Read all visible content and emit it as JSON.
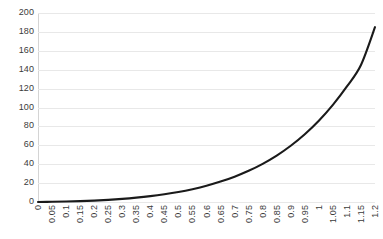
{
  "chart_data": {
    "type": "line",
    "title": "",
    "subtitle": "",
    "xlabel": "",
    "ylabel": "",
    "legend": [],
    "legend_position": "none",
    "grid": true,
    "grid_axis": "y",
    "xlim": [
      0,
      1.2
    ],
    "ylim": [
      0,
      200
    ],
    "yticks": [
      0,
      20,
      40,
      60,
      80,
      100,
      120,
      140,
      160,
      180,
      200
    ],
    "ytick_labels": [
      "0",
      "20",
      "40",
      "60",
      "80",
      "100",
      "120",
      "140",
      "160",
      "180",
      "200"
    ],
    "categories": [
      "0",
      "0.05",
      "0.1",
      "0.15",
      "0.2",
      "0.25",
      "0.3",
      "0.35",
      "0.4",
      "0.45",
      "0.5",
      "0.55",
      "0.6",
      "0.65",
      "0.7",
      "0.75",
      "0.8",
      "0.85",
      "0.9",
      "0.95",
      "1",
      "1.05",
      "1.1",
      "1.15",
      "1.2"
    ],
    "x": [
      0,
      0.05,
      0.1,
      0.15,
      0.2,
      0.25,
      0.3,
      0.35,
      0.4,
      0.45,
      0.5,
      0.55,
      0.6,
      0.65,
      0.7,
      0.75,
      0.8,
      0.85,
      0.9,
      0.95,
      1,
      1.05,
      1.1,
      1.15,
      1.2
    ],
    "values": [
      0,
      0.2,
      0.5,
      0.9,
      1.5,
      2.3,
      3.3,
      4.6,
      6.2,
      8.2,
      10.6,
      13.6,
      17.2,
      21.6,
      26.8,
      33.0,
      40.4,
      49.1,
      59.5,
      71.7,
      86.0,
      102.8,
      122.3,
      145.0,
      185.0
    ],
    "series_color": "#1a1a1a",
    "line_width": 2.1,
    "grid_color": "#e8e8e8",
    "axis_color": "#d4d4d4",
    "tick_label_color": "#3b3b3b",
    "background": "#ffffff",
    "xtick_rotation": 90
  }
}
